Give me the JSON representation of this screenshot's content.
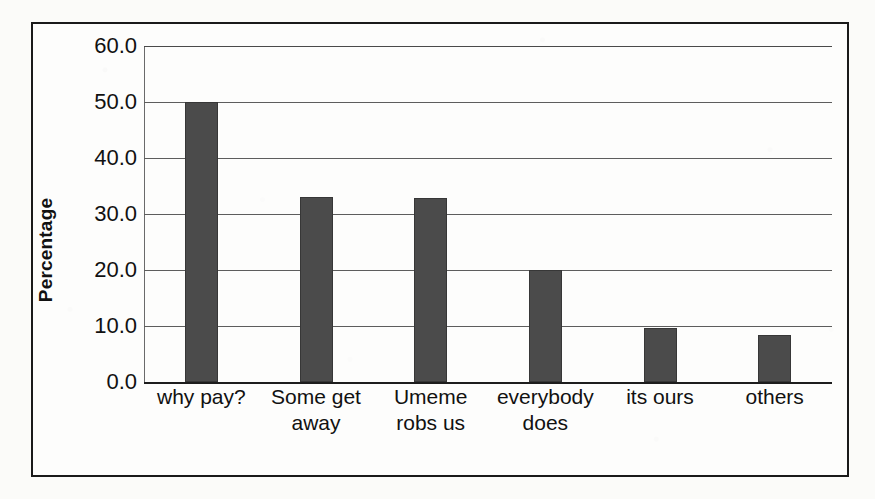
{
  "chart_data": {
    "type": "bar",
    "title": "",
    "xlabel": "",
    "ylabel": "Percentage",
    "ylim": [
      0.0,
      60.0
    ],
    "ytick_step": 10.0,
    "ytick_labels": [
      "60.0",
      "50.0",
      "40.0",
      "30.0",
      "20.0",
      "10.0",
      "0.0"
    ],
    "ytick_values": [
      60.0,
      50.0,
      40.0,
      30.0,
      20.0,
      10.0,
      0.0
    ],
    "grid": true,
    "legend": "none",
    "categories": [
      "why pay?",
      "Some get away",
      "Umeme robs us",
      "everybody does",
      "its ours",
      "others"
    ],
    "values": [
      50.0,
      33.0,
      32.8,
      20.0,
      9.7,
      8.4
    ],
    "series": [
      {
        "name": "Percentage",
        "values": [
          50.0,
          33.0,
          32.8,
          20.0,
          9.7,
          8.4
        ]
      }
    ],
    "bar_color": "#4b4b4b",
    "gridline_color": "#5d5d5d",
    "axis_color": "#1d1d1d",
    "frame_color": "#1a1a1a",
    "background": "#fbfbf9"
  }
}
